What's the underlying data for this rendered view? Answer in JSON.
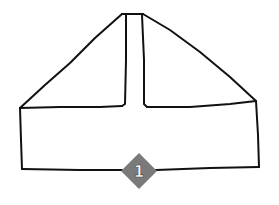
{
  "diagram": {
    "type": "folding-instruction-step",
    "step_badge": {
      "number": "1",
      "fill_color": "#7a7a7a",
      "text_color": "#ffffff"
    },
    "line_color": "#111111",
    "background_color": "#ffffff"
  }
}
